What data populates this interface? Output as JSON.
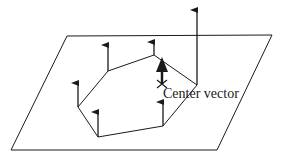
{
  "diagram": {
    "title": "",
    "center_label": "Center vector",
    "plane": {
      "corners": [
        [
          67,
          36
        ],
        [
          272,
          35
        ],
        [
          217,
          150
        ],
        [
          11,
          150
        ]
      ]
    },
    "polygon": {
      "vertices": [
        [
          78,
          107
        ],
        [
          98,
          137
        ],
        [
          163,
          126
        ],
        [
          197,
          85
        ],
        [
          154,
          55
        ],
        [
          108,
          71
        ]
      ]
    },
    "vertex_arrows": [
      {
        "base": [
          78,
          107
        ],
        "tip": [
          78,
          83
        ]
      },
      {
        "base": [
          98,
          137
        ],
        "tip": [
          98,
          112
        ]
      },
      {
        "base": [
          163,
          126
        ],
        "tip": [
          163,
          102
        ]
      },
      {
        "base": [
          197,
          85
        ],
        "tip": [
          197,
          10
        ]
      },
      {
        "base": [
          154,
          55
        ],
        "tip": [
          154,
          42
        ]
      },
      {
        "base": [
          108,
          71
        ],
        "tip": [
          108,
          45
        ]
      }
    ],
    "center_vector": {
      "base": [
        162,
        83
      ],
      "tip": [
        162,
        58
      ]
    },
    "colors": {
      "stroke": "#1a1a1a",
      "background": "#ffffff"
    }
  }
}
